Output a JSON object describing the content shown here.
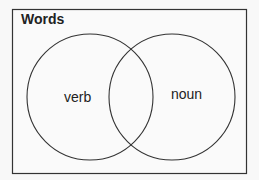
{
  "diagram": {
    "type": "venn",
    "title": "Words",
    "sets": [
      {
        "label": "verb"
      },
      {
        "label": "noun"
      }
    ],
    "colors": {
      "stroke": "#333333",
      "background": "#f8f8f8"
    }
  }
}
